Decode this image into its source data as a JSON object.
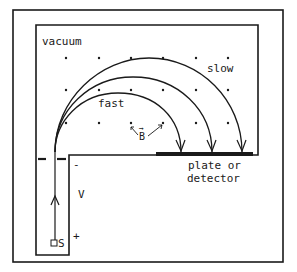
{
  "diagram": {
    "labels": {
      "vacuum": "vacuum",
      "slow": "slow",
      "fast": "fast",
      "field": "B",
      "field_arrow": "→",
      "plate_line1": "plate or",
      "plate_line2": "detector",
      "voltage": "V",
      "minus": "-",
      "plus": "+",
      "source": "S"
    },
    "colors": {
      "ink": "#1a1a1a",
      "background": "#ffffff"
    },
    "trajectories": [
      {
        "name": "fast",
        "landing_x": 181
      },
      {
        "name": "medium",
        "landing_x": 212
      },
      {
        "name": "slow",
        "landing_x": 242
      }
    ],
    "field_dots": {
      "columns": [
        66,
        99,
        131,
        163,
        196,
        228
      ],
      "rows": [
        58,
        90,
        123
      ]
    }
  }
}
